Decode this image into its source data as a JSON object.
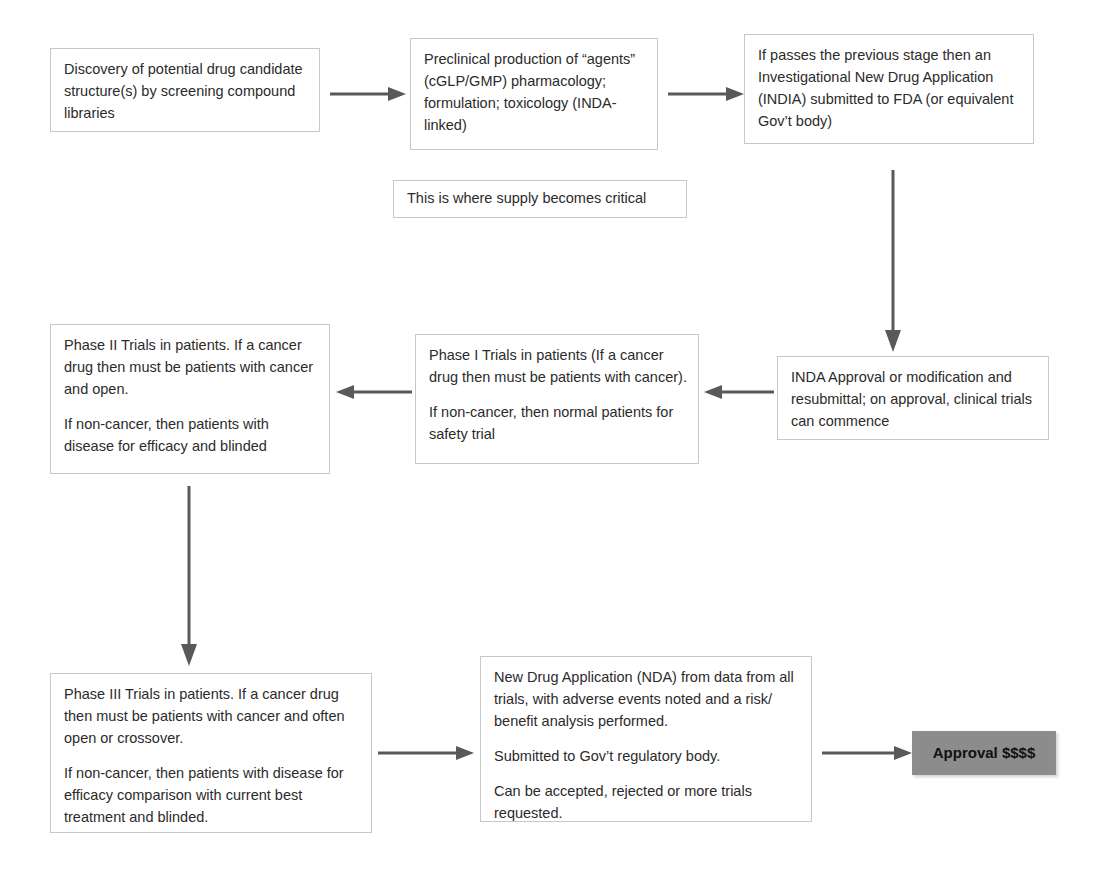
{
  "diagram": {
    "accent_gray": "#8c8c8c",
    "edge_color": "#595959",
    "box_border": "#c8c8c8",
    "nodes": [
      {
        "id": "discovery",
        "name": "discovery-box",
        "paragraphs": [
          "Discovery of potential drug candidate structure(s) by screening compound libraries"
        ]
      },
      {
        "id": "preclinical",
        "name": "preclinical-production-box",
        "paragraphs": [
          "Preclinical production of “agents” (cGLP/GMP) pharmacology; formulation; toxicology (INDA-linked)"
        ]
      },
      {
        "id": "inda-submit",
        "name": "inda-submission-box",
        "paragraphs": [
          "If passes the previous stage then an Investigational New Drug Application (INDIA) submitted to FDA (or equivalent Gov’t body)"
        ]
      },
      {
        "id": "supply-note",
        "name": "supply-critical-note",
        "paragraphs": [
          "This is where supply becomes critical"
        ]
      },
      {
        "id": "inda-approval",
        "name": "inda-approval-box",
        "paragraphs": [
          "INDA Approval or modification and resubmittal; on approval, clinical trials can commence"
        ]
      },
      {
        "id": "phase1",
        "name": "phase-1-trials-box",
        "paragraphs": [
          "Phase I Trials in patients (If a cancer drug then must be patients with cancer).",
          "If non-cancer, then normal patients for safety trial"
        ]
      },
      {
        "id": "phase2",
        "name": "phase-2-trials-box",
        "paragraphs": [
          "Phase II Trials in patients. If a cancer drug then must be patients with cancer and open.",
          "If non-cancer, then patients with disease for efficacy and blinded"
        ]
      },
      {
        "id": "phase3",
        "name": "phase-3-trials-box",
        "paragraphs": [
          "Phase III Trials in patients. If a cancer drug then must be patients with cancer and often open or crossover.",
          "If non-cancer, then patients with disease for efficacy comparison with current best treatment and blinded."
        ]
      },
      {
        "id": "nda",
        "name": "new-drug-application-box",
        "paragraphs": [
          "New Drug Application (NDA) from data from all trials, with adverse events noted and a risk/ benefit analysis performed.",
          "Submitted to Gov’t regulatory body.",
          "Can be accepted, rejected or more trials requested."
        ]
      },
      {
        "id": "approval",
        "name": "approval-terminal-box",
        "paragraphs": [
          "Approval $$$$"
        ]
      }
    ],
    "edges": [
      {
        "id": "e1",
        "name": "arrow-discovery-to-preclinical",
        "direction": "right"
      },
      {
        "id": "e2",
        "name": "arrow-preclinical-to-inda-submission",
        "direction": "right"
      },
      {
        "id": "e3",
        "name": "arrow-inda-submission-to-inda-approval",
        "direction": "down"
      },
      {
        "id": "e4",
        "name": "arrow-inda-approval-to-phase-1",
        "direction": "left"
      },
      {
        "id": "e5",
        "name": "arrow-phase-1-to-phase-2",
        "direction": "left"
      },
      {
        "id": "e6",
        "name": "arrow-phase-2-to-phase-3",
        "direction": "down"
      },
      {
        "id": "e7",
        "name": "arrow-phase-3-to-nda",
        "direction": "right"
      },
      {
        "id": "e8",
        "name": "arrow-nda-to-approval",
        "direction": "right"
      }
    ]
  }
}
